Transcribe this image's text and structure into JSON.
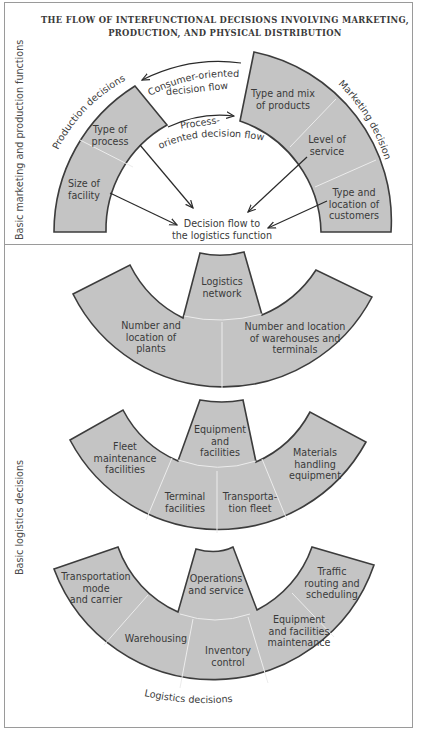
{
  "title": {
    "line1": "THE FLOW OF INTERFUNCTIONAL DECISIONS INVOLVING MARKETING,",
    "line2": "PRODUCTION, AND PHYSICAL DISTRIBUTION"
  },
  "colors": {
    "shape_fill": "#c4c4c4",
    "shape_stroke": "#3c3c3c",
    "divider_line": "#e8e8e8",
    "frame": "#9a9a9a",
    "text": "#3a3a3a"
  },
  "top_section": {
    "side_label": "Basic marketing and production functions",
    "production": {
      "group_label": "Production decisions",
      "segments": [
        "Type of process",
        "Size of facility"
      ],
      "segment_lines": [
        [
          "Type of",
          "process"
        ],
        [
          "Size of",
          "facility"
        ]
      ]
    },
    "marketing": {
      "group_label": "Marketing decisions",
      "segment_lines": [
        [
          "Type and mix",
          "of products"
        ],
        [
          "Level of",
          "service"
        ],
        [
          "Type and",
          "location of",
          "customers"
        ]
      ]
    },
    "flows": {
      "consumer": [
        "Consumer-oriented",
        "decision flow"
      ],
      "process": [
        "Process-",
        "oriented decision flow"
      ],
      "target": [
        "Decision flow to",
        "the logistics function"
      ]
    }
  },
  "bottom_section": {
    "side_label": "Basic logistics decisions",
    "footer_label": "Logistics decisions",
    "tier1": {
      "center": [
        "Logistics",
        "network"
      ],
      "left": [
        "Number and",
        "location of",
        "plants"
      ],
      "right": [
        "Number and location",
        "of warehouses and",
        "terminals"
      ]
    },
    "tier2": {
      "center": [
        "Equipment",
        "and",
        "facilities"
      ],
      "left": [
        "Fleet",
        "maintenance",
        "facilities"
      ],
      "mid_left": [
        "Terminal",
        "facilities"
      ],
      "mid_right": [
        "Transporta-",
        "tion fleet"
      ],
      "right": [
        "Materials",
        "handling",
        "equipment"
      ]
    },
    "tier3": {
      "center": [
        "Operations",
        "and service"
      ],
      "far_left": [
        "Transportation",
        "mode",
        "and carrier"
      ],
      "left": [
        "Warehousing"
      ],
      "middle": [
        "Inventory",
        "control"
      ],
      "right": [
        "Equipment",
        "and facilities",
        "maintenance"
      ],
      "far_right": [
        "Traffic",
        "routing and",
        "scheduling"
      ]
    }
  }
}
